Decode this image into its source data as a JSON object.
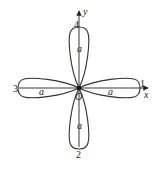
{
  "diagram": {
    "type": "four-petal rose curve",
    "axes": {
      "x_label": "x",
      "y_label": "y",
      "origin_label": "O"
    },
    "petal_tip_labels": {
      "right": "1",
      "bottom": "2",
      "left": "3",
      "top": "4"
    },
    "petal_length_label": "a",
    "colors": {
      "stroke": "#333333",
      "background": "#ffffff"
    }
  }
}
